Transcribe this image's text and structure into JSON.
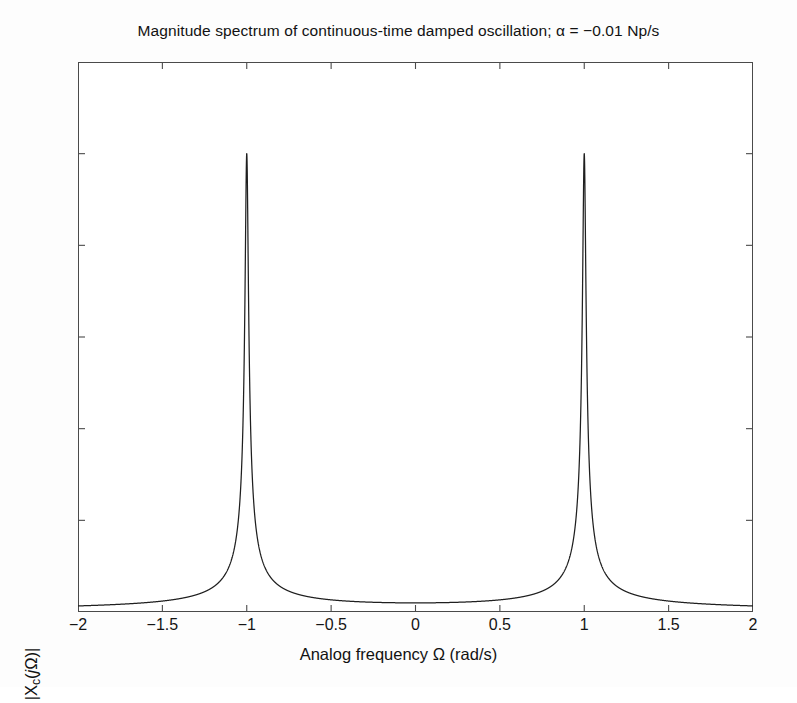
{
  "figure": {
    "background": "#ffffff",
    "axis_color": "#4a4a4a",
    "curve_color": "#1f1f1f"
  },
  "chart_data": {
    "type": "line",
    "title": "Magnitude spectrum of continuous-time damped oscillation; α = −0.01 Np/s",
    "xlabel": "Analog frequency Ω (rad/s)",
    "ylabel": "|Xc(jΩ)|",
    "ylabel_parts": {
      "pre": "|X",
      "sub": "c",
      "mid": "(",
      "ital": "j",
      "post": "Ω)|"
    },
    "xlim": [
      -2,
      2
    ],
    "ylim": [
      0,
      60
    ],
    "xticks": [
      -2,
      -1.5,
      -1,
      -0.5,
      0,
      0.5,
      1,
      1.5,
      2
    ],
    "xtick_labels": [
      "−2",
      "−1.5",
      "−1",
      "−0.5",
      "0",
      "0.5",
      "1",
      "1.5",
      "2"
    ],
    "yticks": [
      0,
      10,
      20,
      30,
      40,
      50,
      60
    ],
    "ytick_labels": [
      "0",
      "10",
      "20",
      "30",
      "40",
      "50",
      "60"
    ],
    "grid": false,
    "legend": null,
    "annotations": [],
    "model": {
      "description": "Sum of two Lorentzian resonances centered at Ω = −1 and Ω = +1",
      "alpha_Np_per_s": -0.01,
      "resonance_frequencies": [
        -1,
        1
      ],
      "peak_amplitude": 50,
      "amplitude_scale": 0.5,
      "half_width": 0.01
    },
    "key_points": [
      {
        "x": -2.0,
        "y": 1.0
      },
      {
        "x": -1.5,
        "y": 1.4
      },
      {
        "x": -1.25,
        "y": 2.3
      },
      {
        "x": -1.1,
        "y": 5.0
      },
      {
        "x": -1.05,
        "y": 10.0
      },
      {
        "x": -1.02,
        "y": 24.9
      },
      {
        "x": -1.01,
        "y": 35.4
      },
      {
        "x": -1.0,
        "y": 50.0
      },
      {
        "x": -0.99,
        "y": 35.4
      },
      {
        "x": -0.98,
        "y": 24.9
      },
      {
        "x": -0.95,
        "y": 10.0
      },
      {
        "x": -0.9,
        "y": 5.0
      },
      {
        "x": -0.75,
        "y": 2.3
      },
      {
        "x": -0.5,
        "y": 1.3
      },
      {
        "x": -0.25,
        "y": 0.8
      },
      {
        "x": 0.0,
        "y": 0.0
      },
      {
        "x": 0.25,
        "y": 0.8
      },
      {
        "x": 0.5,
        "y": 1.3
      },
      {
        "x": 0.75,
        "y": 2.3
      },
      {
        "x": 0.9,
        "y": 5.0
      },
      {
        "x": 0.95,
        "y": 10.0
      },
      {
        "x": 0.98,
        "y": 24.9
      },
      {
        "x": 0.99,
        "y": 35.4
      },
      {
        "x": 1.0,
        "y": 50.0
      },
      {
        "x": 1.01,
        "y": 35.4
      },
      {
        "x": 1.02,
        "y": 24.9
      },
      {
        "x": 1.05,
        "y": 10.0
      },
      {
        "x": 1.1,
        "y": 5.0
      },
      {
        "x": 1.25,
        "y": 2.3
      },
      {
        "x": 1.5,
        "y": 1.4
      },
      {
        "x": 2.0,
        "y": 1.0
      }
    ]
  }
}
